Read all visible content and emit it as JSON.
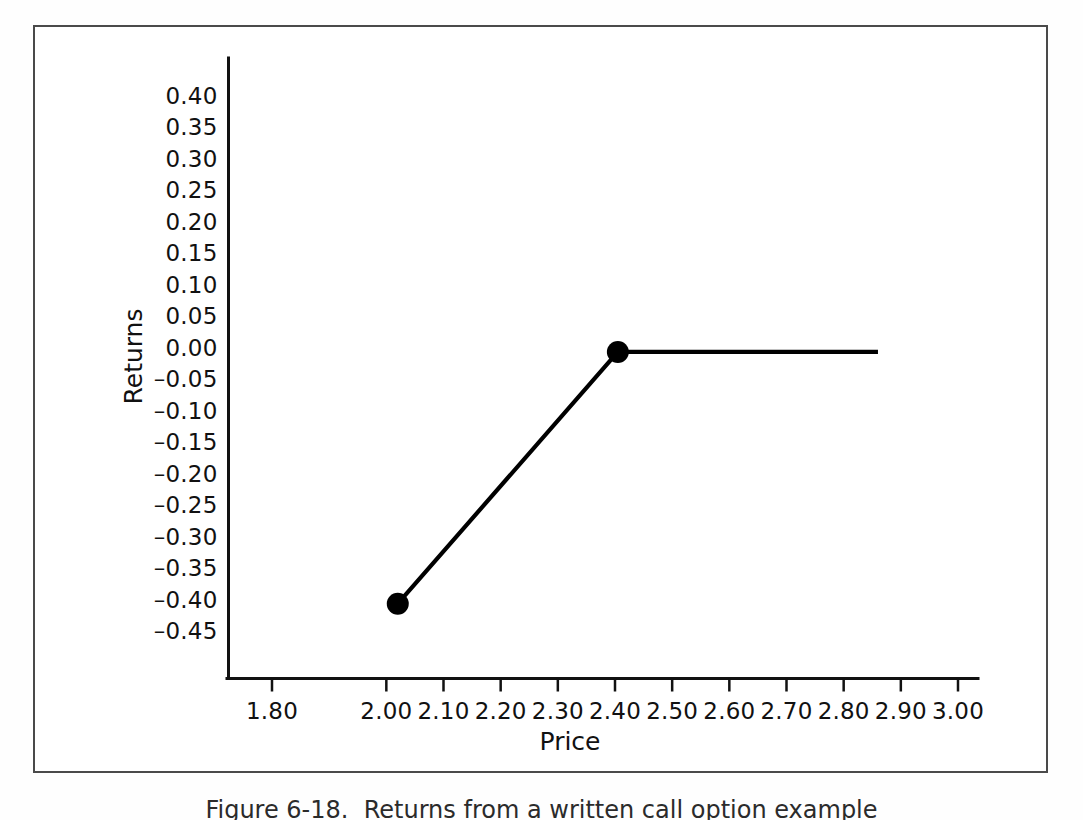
{
  "figure": {
    "caption": "Figure 6-18.  Returns from a written call option example",
    "frame_color": "#4a4a4a",
    "line_color": "#000000"
  },
  "chart_data": {
    "type": "line",
    "title": "",
    "xlabel": "Price",
    "ylabel": "Returns",
    "xlim": [
      1.72,
      3.04
    ],
    "ylim": [
      -0.475,
      0.425
    ],
    "grid": false,
    "legend": "none",
    "x_ticks": [
      "1.80",
      "2.00",
      "2.10",
      "2.20",
      "2.30",
      "2.40",
      "2.50",
      "2.60",
      "2.70",
      "2.80",
      "2.90",
      "3.00"
    ],
    "x_tick_values": [
      1.8,
      2.0,
      2.1,
      2.2,
      2.3,
      2.4,
      2.5,
      2.6,
      2.7,
      2.8,
      2.9,
      3.0
    ],
    "y_ticks": [
      "0.40",
      "0.35",
      "0.30",
      "0.25",
      "0.20",
      "0.15",
      "0.10",
      "0.05",
      "0.00",
      "–0.05",
      "–0.10",
      "–0.15",
      "–0.20",
      "–0.25",
      "–0.30",
      "–0.35",
      "–0.40",
      "–0.45"
    ],
    "y_tick_values": [
      0.4,
      0.35,
      0.3,
      0.25,
      0.2,
      0.15,
      0.1,
      0.05,
      0.0,
      -0.05,
      -0.1,
      -0.15,
      -0.2,
      -0.25,
      -0.3,
      -0.35,
      -0.4,
      -0.45
    ],
    "series": [
      {
        "name": "Written call option returns",
        "x": [
          2.02,
          2.405,
          2.86
        ],
        "y": [
          -0.405,
          -0.005,
          -0.005
        ],
        "markers_at": [
          [
            2.02,
            -0.405
          ],
          [
            2.405,
            -0.005
          ]
        ],
        "marker_radius": 11
      }
    ]
  }
}
